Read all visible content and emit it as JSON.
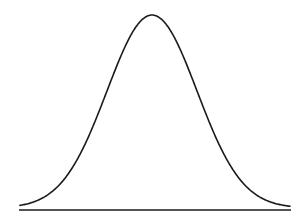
{
  "chart_data": {
    "type": "line",
    "title": "",
    "xlabel": "",
    "ylabel": "",
    "distribution": "normal",
    "mean": 0,
    "std": 1,
    "x_range": [
      -3,
      3
    ],
    "grid": false,
    "legend": null,
    "series": [
      {
        "name": "density",
        "x": [
          -3,
          -2.5,
          -2,
          -1.5,
          -1,
          -0.5,
          0,
          0.5,
          1,
          1.5,
          2,
          2.5,
          3
        ],
        "values": [
          0.004,
          0.018,
          0.054,
          0.13,
          0.242,
          0.352,
          0.399,
          0.352,
          0.242,
          0.13,
          0.054,
          0.018,
          0.004
        ]
      }
    ],
    "colors": {
      "curve": "#1a1a1a",
      "baseline": "#1a1a1a",
      "background": "#ffffff"
    }
  },
  "layout": {
    "center_px": 152,
    "sigma_px": 45,
    "peak_y_px": 17,
    "baseline_y_px": 210,
    "curve_x_start_px": 20,
    "curve_x_end_px": 290,
    "baseline_x_start_px": 19,
    "baseline_x_end_px": 291
  }
}
